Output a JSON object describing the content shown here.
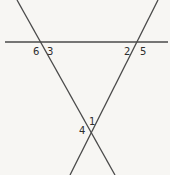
{
  "figure": {
    "background_color": "#f7f6f3",
    "line_color": "#4a4a4a",
    "label_color": "#2e2e2e",
    "width": 170,
    "height": 175
  },
  "lines": [
    {
      "name": "horizontal-line",
      "x1": 5,
      "y1": 42,
      "x2": 168,
      "y2": 42,
      "stroke_width": 1.6
    },
    {
      "name": "left-transversal",
      "x1": 17,
      "y1": 0,
      "x2": 115,
      "y2": 175,
      "stroke_width": 1.3
    },
    {
      "name": "right-transversal",
      "x1": 158,
      "y1": 0,
      "x2": 70,
      "y2": 175,
      "stroke_width": 1.3
    }
  ],
  "labels": [
    {
      "id": "label-6",
      "text": "6",
      "x": 33,
      "y": 47
    },
    {
      "id": "label-3",
      "text": "3",
      "x": 47,
      "y": 47
    },
    {
      "id": "label-2",
      "text": "2",
      "x": 124,
      "y": 47
    },
    {
      "id": "label-5",
      "text": "5",
      "x": 140,
      "y": 47
    },
    {
      "id": "label-1",
      "text": "1",
      "x": 89,
      "y": 117
    },
    {
      "id": "label-4",
      "text": "4",
      "x": 79,
      "y": 126
    }
  ]
}
